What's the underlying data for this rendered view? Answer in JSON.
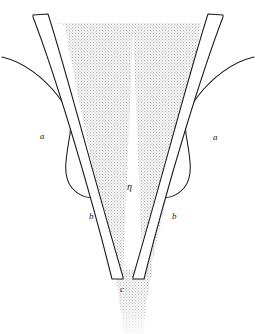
{
  "figure": {
    "type": "anatomical-line-diagram",
    "title": "",
    "background_color": "#ffffff",
    "stroke_color": "#1a1a1a",
    "stipple_color": "#b4b4b4",
    "stipple_fill_name": "dotted-halftone-shading",
    "tube_fill_color": "#ffffff",
    "width": 256,
    "height": 334
  },
  "labels": [
    {
      "id": "a-left",
      "text": "a",
      "x": 40,
      "y": 132,
      "style": "italic"
    },
    {
      "id": "a-right",
      "text": "a",
      "x": 213,
      "y": 133,
      "style": "italic"
    },
    {
      "id": "b-left",
      "text": "b",
      "x": 89,
      "y": 212,
      "style": "italic"
    },
    {
      "id": "b-right",
      "text": "b",
      "x": 172,
      "y": 212,
      "style": "italic"
    },
    {
      "id": "eta-center",
      "text": "η",
      "x": 127,
      "y": 182,
      "style": "greek-italic"
    },
    {
      "id": "c-bottom",
      "text": "c",
      "x": 120,
      "y": 285,
      "style": "italic"
    }
  ],
  "parts": [
    {
      "id": "left-tube",
      "label_ref": "b-left",
      "description": "left elongated tube"
    },
    {
      "id": "right-tube",
      "label_ref": "b-right",
      "description": "right elongated tube"
    },
    {
      "id": "left-lobe",
      "label_ref": "a-left",
      "description": "left outer curved lobe"
    },
    {
      "id": "right-lobe",
      "label_ref": "a-right",
      "description": "right outer curved lobe"
    },
    {
      "id": "central-shaded-region",
      "label_ref": "eta-center",
      "description": "stippled funnel-shaped central region"
    },
    {
      "id": "distal-outlet",
      "label_ref": "c-bottom",
      "description": "distal narrow outlet below tube ends"
    }
  ]
}
